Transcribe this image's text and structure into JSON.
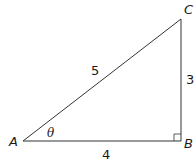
{
  "figure": {
    "type": "right-triangle",
    "line_color": "#333333",
    "text_color": "#1a1a1a",
    "vertices": {
      "A": {
        "label": "A",
        "x": 23,
        "y": 141
      },
      "B": {
        "label": "B",
        "x": 181,
        "y": 141
      },
      "C": {
        "label": "C",
        "x": 181,
        "y": 19
      }
    },
    "sides": {
      "hypotenuse_AC": {
        "label": "5"
      },
      "vertical_BC": {
        "label": "3"
      },
      "base_AB": {
        "label": "4"
      }
    },
    "angle_at_A": {
      "label": "θ"
    },
    "right_angle_at": "B"
  }
}
